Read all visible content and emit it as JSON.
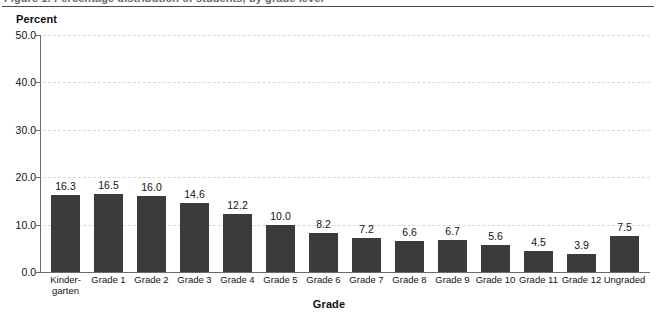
{
  "caption": {
    "text": "Figure 1. Percentage distribution of students, by grade level"
  },
  "chart_data": {
    "type": "bar",
    "title": "",
    "xlabel": "Grade",
    "ylabel": "Percent",
    "categories": [
      "Kinder-\ngarten",
      "Grade 1",
      "Grade 2",
      "Grade 3",
      "Grade 4",
      "Grade 5",
      "Grade 6",
      "Grade 7",
      "Grade 8",
      "Grade 9",
      "Grade 10",
      "Grade 11",
      "Grade 12",
      "Ungraded"
    ],
    "values": [
      16.3,
      16.5,
      16.0,
      14.6,
      12.2,
      10.0,
      8.2,
      7.2,
      6.6,
      6.7,
      5.6,
      4.5,
      3.9,
      7.5
    ],
    "ylim": [
      0.0,
      50.0
    ],
    "yticks": [
      "0.0",
      "10.0",
      "20.0",
      "30.0",
      "40.0",
      "50.0"
    ],
    "ytick_values": [
      0.0,
      10.0,
      20.0,
      30.0,
      40.0,
      50.0
    ],
    "grid": true,
    "legend": "none",
    "bar_color": "#3b3b3b",
    "grid_color": "#d8d8d8",
    "axis_color": "#6b6b6b"
  }
}
